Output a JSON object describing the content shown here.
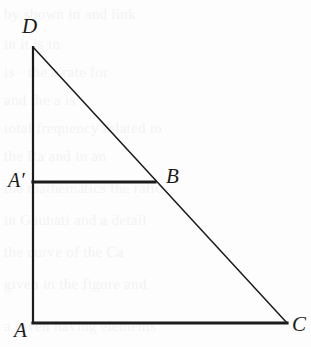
{
  "figure": {
    "type": "geometry-diagram",
    "background_color": "#fdfdfd",
    "stroke_color": "#1b1b1b",
    "labels": {
      "D": "D",
      "A_prime": "A′",
      "B": "B",
      "A": "A",
      "C": "C"
    },
    "points": {
      "D": {
        "x": 33,
        "y": 47
      },
      "A_prime": {
        "x": 33,
        "y": 182
      },
      "B": {
        "x": 155,
        "y": 182
      },
      "A": {
        "x": 33,
        "y": 323
      },
      "C": {
        "x": 287,
        "y": 323
      }
    },
    "segments": [
      {
        "name": "DA",
        "from": "D",
        "to": "A",
        "width": 2.2
      },
      {
        "name": "DC",
        "from": "D",
        "to": "C",
        "width": 1.5
      },
      {
        "name": "AC",
        "from": "A",
        "to": "C",
        "width": 3.2
      },
      {
        "name": "A_prime_B",
        "from": "A_prime",
        "to": "B",
        "width": 3.2
      }
    ]
  },
  "ghost_text": {
    "lines": [
      "by shown in and link",
      "in it is in",
      "is · the a  rate for",
      "and the  a is",
      "total frequency related to",
      "the  Ra  and in an",
      "the mathematics the ratio",
      "in  Gauhati  and  a  detail",
      "the  curve of the  Ca",
      "given  in the  figure  and",
      "a given  having  elements"
    ]
  }
}
